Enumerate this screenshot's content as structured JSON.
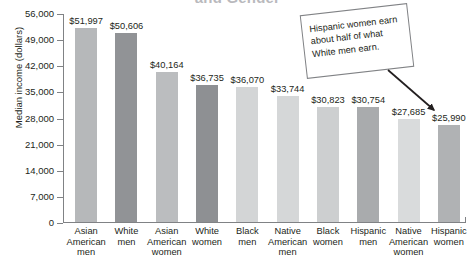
{
  "chart_data": {
    "type": "bar",
    "title": "and Gender",
    "xlabel": "",
    "ylabel": "Median income (dollars)",
    "ylim": [
      0,
      56000
    ],
    "ytick_labels": [
      "56,000",
      "49,000",
      "42,000",
      "35,000",
      "28,000",
      "21,000",
      "14,000",
      "7,000",
      "0"
    ],
    "ytick_values": [
      56000,
      49000,
      42000,
      35000,
      28000,
      21000,
      14000,
      7000,
      0
    ],
    "grid": false,
    "legend": "none",
    "categories": [
      "Asian\nAmerican\nmen",
      "White\nmen",
      "Asian\nAmerican\nwomen",
      "White\nwomen",
      "Black\nmen",
      "Native\nAmerican\nmen",
      "Black\nwomen",
      "Hispanic\nmen",
      "Native\nAmerican\nwomen",
      "Hispanic\nwomen"
    ],
    "values": [
      51997,
      50606,
      40164,
      36735,
      36070,
      33744,
      30823,
      30754,
      27685,
      25990
    ],
    "value_labels": [
      "$51,997",
      "$50,606",
      "$40,164",
      "$36,735",
      "$36,070",
      "$33,744",
      "$30,823",
      "$30,754",
      "$27,685",
      "$25,990"
    ],
    "bar_colors": [
      "#b6b8ba",
      "#919396",
      "#bbbdbf",
      "#8e9093",
      "#d3d5d6",
      "#d5d7d8",
      "#cdcfd0",
      "#a9abad",
      "#d9dbdc",
      "#b0b2b4"
    ],
    "annotations": [
      {
        "text": "Hispanic women earn about half of what White men earn.",
        "points_to": "Hispanic\nwomen"
      }
    ]
  },
  "colors": {
    "axis": "#808285",
    "text": "#231f20",
    "title": "#b9b9bd",
    "callout_border": "#808285"
  }
}
